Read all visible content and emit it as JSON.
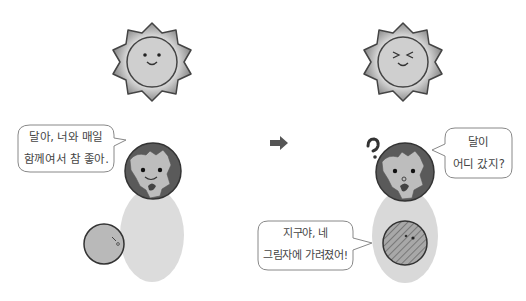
{
  "colors": {
    "background": "#ffffff",
    "sun_fill": "#c8c8c8",
    "sun_rays": "#9a9a9a",
    "outline": "#333333",
    "earth_ocean": "#5a5a5a",
    "earth_land": "#bdbdbd",
    "shadow": "#d9d9d9",
    "moon_fill": "#b9b9b9",
    "arrow": "#555555",
    "bubble_border": "#888888",
    "text": "#444444"
  },
  "panels": [
    {
      "name": "before",
      "sun": {
        "icon": "smiling-sun-icon",
        "expression": "smile"
      },
      "earth": {
        "icon": "worried-earth-icon"
      },
      "moon": {
        "icon": "moon-icon",
        "state": "visible"
      },
      "speech": {
        "line1": "달아, 너와 매일",
        "line2": "함께여서 참 좋아."
      }
    },
    {
      "name": "after",
      "sun": {
        "icon": "laughing-sun-icon",
        "expression": "squint"
      },
      "earth": {
        "icon": "confused-earth-icon",
        "mark": "?"
      },
      "moon": {
        "icon": "shaded-moon-icon",
        "state": "eclipsed"
      },
      "speech_earth": {
        "line1": "달이",
        "line2": "어디 갔지?"
      },
      "speech_moon": {
        "line1": "지구야, 네",
        "line2": "그림자에 가려졌어!"
      }
    }
  ],
  "transition": {
    "icon": "right-arrow-icon"
  }
}
